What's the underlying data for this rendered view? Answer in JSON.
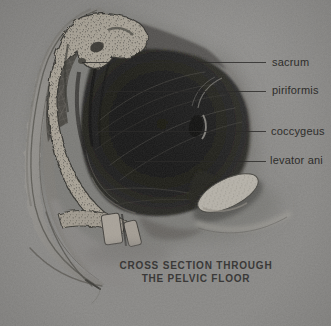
{
  "illustration": {
    "alt": "Graphite cross-section drawing of the pelvis on gray paper",
    "subject_parts": [
      "sacrum",
      "piriformis",
      "coccygeus",
      "levator ani",
      "pubic symphysis",
      "coccyx"
    ]
  },
  "annotations": [
    {
      "label": "sacrum"
    },
    {
      "label": "piriformis"
    },
    {
      "label": "coccygeus"
    },
    {
      "label": "levator ani"
    }
  ],
  "caption": {
    "line1": "CROSS SECTION THROUGH",
    "line2": "THE PELVIC FLOOR"
  },
  "colors": {
    "paper": "#8b8a88",
    "leader_line": "#2c2b29",
    "label_text": "#2e2d2b",
    "caption_text": "#3a3938",
    "muscle_dark": "#1b1b19",
    "bone_light": "#a59f93",
    "pubis_light": "#b3afa6"
  }
}
